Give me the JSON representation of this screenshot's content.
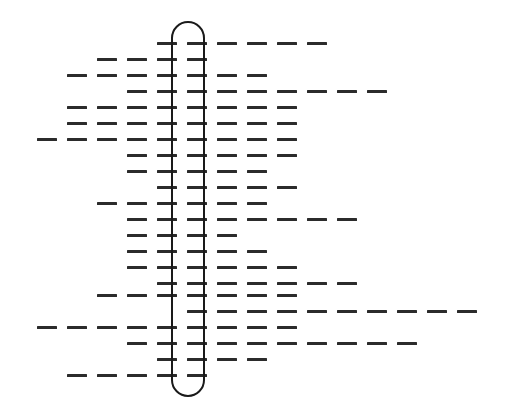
{
  "figure": {
    "width": 506,
    "height": 417,
    "background_color": "#ffffff",
    "dash_color": "#2b2b2b",
    "capsule_stroke_color": "#1a1a1a"
  },
  "capsule": {
    "label": "vertical rounded capsule outline",
    "x": 171,
    "y": 21,
    "width": 34,
    "height": 376,
    "corner_radius": 17,
    "stroke_width": 2,
    "fill": "none"
  },
  "grid": {
    "column_pitch": 30,
    "column_origin": 7,
    "row_pitch": 16,
    "row_origin": 42,
    "dash_length": 20,
    "dash_thickness": 3,
    "row_count": 22,
    "column_count": 17
  },
  "chart_data": {
    "type": "bar",
    "xlabel": "",
    "ylabel": "",
    "grid": false,
    "legend": null,
    "orientation": "horizontal",
    "note": "Each row is a horizontal dashed line spanning a start column to an end column on a 30px column grid; the vertical capsule outline is drawn over columns 6-7.",
    "categories": [
      "row-1",
      "row-2",
      "row-3",
      "row-4",
      "row-5",
      "row-6",
      "row-7",
      "row-8",
      "row-9",
      "row-10",
      "row-11",
      "row-12",
      "row-13",
      "row-14",
      "row-15",
      "row-16",
      "row-17",
      "row-18",
      "row-19",
      "row-20",
      "row-21",
      "row-22"
    ],
    "rows": [
      {
        "name": "row-1",
        "y": 42,
        "start_col": 5,
        "end_col": 10
      },
      {
        "name": "row-2",
        "y": 58,
        "start_col": 3,
        "end_col": 6
      },
      {
        "name": "row-3",
        "y": 74,
        "start_col": 2,
        "end_col": 8
      },
      {
        "name": "row-4",
        "y": 90,
        "start_col": 4,
        "end_col": 12
      },
      {
        "name": "row-5",
        "y": 106,
        "start_col": 2,
        "end_col": 9
      },
      {
        "name": "row-6",
        "y": 122,
        "start_col": 2,
        "end_col": 9
      },
      {
        "name": "row-7",
        "y": 138,
        "start_col": 1,
        "end_col": 9
      },
      {
        "name": "row-8",
        "y": 154,
        "start_col": 4,
        "end_col": 9
      },
      {
        "name": "row-9",
        "y": 170,
        "start_col": 4,
        "end_col": 8
      },
      {
        "name": "row-10",
        "y": 186,
        "start_col": 5,
        "end_col": 9
      },
      {
        "name": "row-11",
        "y": 202,
        "start_col": 3,
        "end_col": 8
      },
      {
        "name": "row-12",
        "y": 218,
        "start_col": 4,
        "end_col": 11
      },
      {
        "name": "row-13",
        "y": 234,
        "start_col": 4,
        "end_col": 7
      },
      {
        "name": "row-14",
        "y": 250,
        "start_col": 4,
        "end_col": 8
      },
      {
        "name": "row-15",
        "y": 266,
        "start_col": 4,
        "end_col": 9
      },
      {
        "name": "row-16",
        "y": 282,
        "start_col": 5,
        "end_col": 11
      },
      {
        "name": "row-17",
        "y": 294,
        "start_col": 3,
        "end_col": 9
      },
      {
        "name": "row-18",
        "y": 310,
        "start_col": 6,
        "end_col": 16
      },
      {
        "name": "row-19",
        "y": 326,
        "start_col": 1,
        "end_col": 9
      },
      {
        "name": "row-20",
        "y": 342,
        "start_col": 4,
        "end_col": 13
      },
      {
        "name": "row-21",
        "y": 358,
        "start_col": 5,
        "end_col": 8
      },
      {
        "name": "row-22",
        "y": 374,
        "start_col": 2,
        "end_col": 6
      }
    ],
    "values": [
      6,
      4,
      7,
      9,
      8,
      8,
      9,
      6,
      5,
      5,
      6,
      8,
      4,
      5,
      6,
      7,
      7,
      11,
      9,
      10,
      4,
      5
    ],
    "xlim": [
      0,
      17
    ],
    "ylim": [
      0,
      22
    ]
  }
}
